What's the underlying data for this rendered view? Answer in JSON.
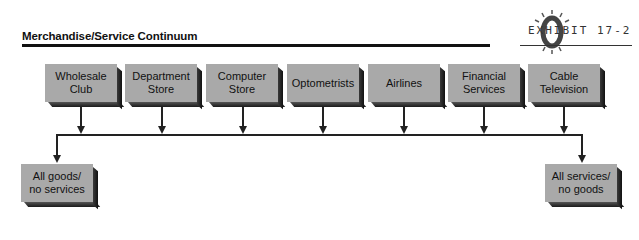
{
  "header": {
    "title": "Merchandise/Service Continuum",
    "exhibit_label": "EXHIBIT 17-2"
  },
  "diagram": {
    "top_boxes": [
      {
        "label": "Wholesale Club",
        "line1": "Wholesale",
        "line2": "Club"
      },
      {
        "label": "Department Store",
        "line1": "Department",
        "line2": "Store"
      },
      {
        "label": "Computer Store",
        "line1": "Computer",
        "line2": "Store"
      },
      {
        "label": "Optometrists",
        "line1": "Optometrists",
        "line2": ""
      },
      {
        "label": "Airlines",
        "line1": "Airlines",
        "line2": ""
      },
      {
        "label": "Financial Services",
        "line1": "Financial",
        "line2": "Services"
      },
      {
        "label": "Cable Television",
        "line1": "Cable",
        "line2": "Television"
      }
    ],
    "endpoints": {
      "left": {
        "line1": "All goods/",
        "line2": "no services"
      },
      "right": {
        "line1": "All services/",
        "line2": "no goods"
      }
    }
  },
  "colors": {
    "box_fill": "#a9a9a9",
    "line": "#222222",
    "text": "#111111"
  }
}
